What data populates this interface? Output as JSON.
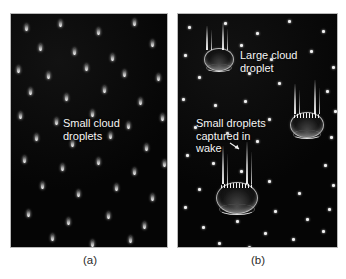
{
  "figure": {
    "background_color": "#ffffff",
    "panel_background_color": "#050505",
    "panel_border_color": "#b9b9b9",
    "droplet_color": "#ffffff",
    "label_color": "#2a2a2a",
    "annotation_color": "#f5f5f5"
  },
  "panels": [
    {
      "id": "a",
      "label": "(a)",
      "annotation": "Small cloud\ndroplets",
      "annotation_line1": "Small cloud",
      "annotation_line2": "droplets",
      "droplet_count": 38,
      "droplet_kind": "small-teardrop"
    },
    {
      "id": "b",
      "label": "(b)",
      "annotation_top": "Large cloud\ndroplet",
      "annotation_top_line1": "Large cloud",
      "annotation_top_line2": "droplet",
      "annotation_bottom": "Small droplets\ncaptured in\nwake",
      "annotation_bottom_line1": "Small droplets",
      "annotation_bottom_line2": "captured in",
      "annotation_bottom_line3": "wake",
      "droplet_count": 46,
      "large_droplet_count": 3,
      "droplet_kind": "small-dot"
    }
  ],
  "chart_data": {
    "type": "diagram",
    "panels": [
      {
        "name": "(a)",
        "description": "Field of uniformly small cloud droplets falling at similar speeds",
        "small_droplets": [
          {
            "x": 14,
            "y": 10
          },
          {
            "x": 48,
            "y": 6
          },
          {
            "x": 86,
            "y": 14
          },
          {
            "x": 122,
            "y": 5
          },
          {
            "x": 140,
            "y": 26
          },
          {
            "x": 28,
            "y": 30
          },
          {
            "x": 62,
            "y": 34
          },
          {
            "x": 100,
            "y": 40
          },
          {
            "x": 6,
            "y": 52
          },
          {
            "x": 36,
            "y": 58
          },
          {
            "x": 74,
            "y": 50
          },
          {
            "x": 112,
            "y": 56
          },
          {
            "x": 146,
            "y": 60
          },
          {
            "x": 18,
            "y": 74
          },
          {
            "x": 54,
            "y": 80
          },
          {
            "x": 92,
            "y": 72
          },
          {
            "x": 128,
            "y": 84
          },
          {
            "x": 8,
            "y": 98
          },
          {
            "x": 44,
            "y": 104
          },
          {
            "x": 80,
            "y": 96
          },
          {
            "x": 116,
            "y": 108
          },
          {
            "x": 150,
            "y": 100
          },
          {
            "x": 24,
            "y": 120
          },
          {
            "x": 60,
            "y": 126
          },
          {
            "x": 98,
            "y": 118
          },
          {
            "x": 134,
            "y": 130
          },
          {
            "x": 12,
            "y": 142
          },
          {
            "x": 50,
            "y": 150
          },
          {
            "x": 86,
            "y": 144
          },
          {
            "x": 122,
            "y": 154
          },
          {
            "x": 152,
            "y": 146
          },
          {
            "x": 30,
            "y": 168
          },
          {
            "x": 66,
            "y": 176
          },
          {
            "x": 104,
            "y": 170
          },
          {
            "x": 140,
            "y": 180
          },
          {
            "x": 16,
            "y": 196
          },
          {
            "x": 56,
            "y": 204
          },
          {
            "x": 96,
            "y": 198
          },
          {
            "x": 132,
            "y": 208
          },
          {
            "x": 40,
            "y": 220
          },
          {
            "x": 80,
            "y": 226
          },
          {
            "x": 118,
            "y": 222
          }
        ]
      },
      {
        "name": "(b)",
        "description": "Large cloud droplets falling faster, trailing wakes that capture small droplets",
        "large_droplets": [
          {
            "x": 26,
            "y": 34,
            "w": 30,
            "h": 23,
            "has_captured": false
          },
          {
            "x": 112,
            "y": 98,
            "w": 34,
            "h": 26,
            "has_captured": true
          },
          {
            "x": 38,
            "y": 168,
            "w": 42,
            "h": 32,
            "has_captured": true
          }
        ],
        "small_droplets": [
          {
            "x": 10,
            "y": 12
          },
          {
            "x": 46,
            "y": 8
          },
          {
            "x": 78,
            "y": 18
          },
          {
            "x": 110,
            "y": 6
          },
          {
            "x": 144,
            "y": 16
          },
          {
            "x": 6,
            "y": 40
          },
          {
            "x": 62,
            "y": 30
          },
          {
            "x": 92,
            "y": 44
          },
          {
            "x": 132,
            "y": 36
          },
          {
            "x": 154,
            "y": 52
          },
          {
            "x": 20,
            "y": 62
          },
          {
            "x": 70,
            "y": 58
          },
          {
            "x": 100,
            "y": 68
          },
          {
            "x": 148,
            "y": 76
          },
          {
            "x": 4,
            "y": 84
          },
          {
            "x": 36,
            "y": 90
          },
          {
            "x": 66,
            "y": 86
          },
          {
            "x": 90,
            "y": 104
          },
          {
            "x": 156,
            "y": 96
          },
          {
            "x": 16,
            "y": 112
          },
          {
            "x": 48,
            "y": 118
          },
          {
            "x": 78,
            "y": 126
          },
          {
            "x": 152,
            "y": 122
          },
          {
            "x": 8,
            "y": 140
          },
          {
            "x": 34,
            "y": 148
          },
          {
            "x": 62,
            "y": 156
          },
          {
            "x": 146,
            "y": 150
          },
          {
            "x": 20,
            "y": 174
          },
          {
            "x": 90,
            "y": 166
          },
          {
            "x": 120,
            "y": 178
          },
          {
            "x": 154,
            "y": 170
          },
          {
            "x": 6,
            "y": 192
          },
          {
            "x": 96,
            "y": 196
          },
          {
            "x": 128,
            "y": 204
          },
          {
            "x": 150,
            "y": 194
          },
          {
            "x": 24,
            "y": 212
          },
          {
            "x": 58,
            "y": 206
          },
          {
            "x": 86,
            "y": 218
          },
          {
            "x": 114,
            "y": 224
          },
          {
            "x": 144,
            "y": 216
          },
          {
            "x": 40,
            "y": 228
          },
          {
            "x": 70,
            "y": 232
          }
        ]
      }
    ]
  }
}
